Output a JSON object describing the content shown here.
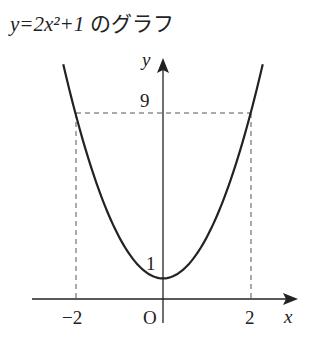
{
  "title": {
    "equation": "y=2x²+1",
    "suffix": " のグラフ"
  },
  "chart_data": {
    "type": "line",
    "title": "y=2x²+1 のグラフ",
    "function": "y = 2x^2 + 1",
    "xlabel": "x",
    "ylabel": "y",
    "x": [
      -2.25,
      -2,
      -1.5,
      -1,
      -0.5,
      0,
      0.5,
      1,
      1.5,
      2,
      2.25
    ],
    "y": [
      11.125,
      9,
      5.5,
      3,
      1.5,
      1,
      1.5,
      3,
      5.5,
      9,
      11.125
    ],
    "x_ticks": [
      "-2",
      "O",
      "2"
    ],
    "y_ticks": [
      "1",
      "9"
    ],
    "annotations": [
      {
        "type": "dashed-guide",
        "from": [
          -2,
          0
        ],
        "to": [
          -2,
          9
        ]
      },
      {
        "type": "dashed-guide",
        "from": [
          2,
          0
        ],
        "to": [
          2,
          9
        ]
      },
      {
        "type": "dashed-guide",
        "from": [
          -2,
          9
        ],
        "to": [
          2,
          9
        ]
      }
    ],
    "grid": false
  },
  "labels": {
    "x_axis": "x",
    "y_axis": "y",
    "origin": "O",
    "x_neg2": "−2",
    "x_pos2": "2",
    "y_1": "1",
    "y_9": "9"
  }
}
